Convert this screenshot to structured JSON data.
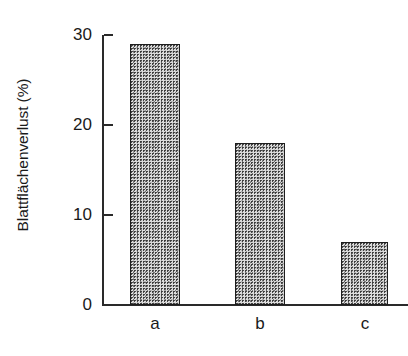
{
  "chart_data": {
    "type": "bar",
    "title": "",
    "subtitle": "",
    "xlabel": "",
    "ylabel": "Blattflächenverlust (%)",
    "categories": [
      "a",
      "b",
      "c"
    ],
    "values": [
      29,
      18,
      7
    ],
    "ylim": [
      0,
      30
    ],
    "yticks": [
      0,
      10,
      20,
      30
    ],
    "ytick_labels": [
      "0",
      "10",
      "20",
      "30"
    ],
    "xtick_labels": [
      "a",
      "b",
      "c"
    ],
    "grid": false,
    "legend": null,
    "annotations": [],
    "bar_fill": "#dcdcdc",
    "bar_edge": "#1e1e1e",
    "axis_color": "#2a2a2a"
  },
  "axis": {
    "y_title": "Blattflächenverlust (%)",
    "ticks": [
      {
        "label": "30",
        "value": 30
      },
      {
        "label": "20",
        "value": 20
      },
      {
        "label": "10",
        "value": 10
      },
      {
        "label": "0",
        "value": 0
      }
    ]
  },
  "bars": [
    {
      "label": "a",
      "value": 29
    },
    {
      "label": "b",
      "value": 18
    },
    {
      "label": "c",
      "value": 7
    }
  ]
}
